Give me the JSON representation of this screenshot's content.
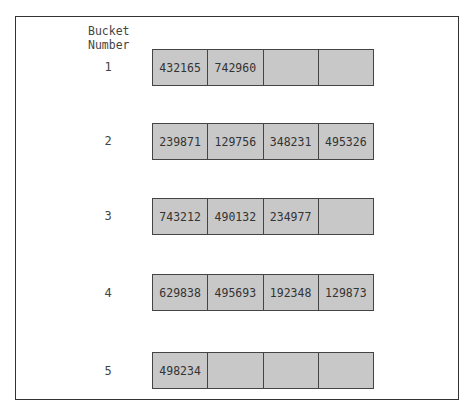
{
  "header": {
    "line1": "Bucket",
    "line2": "Number"
  },
  "colors": {
    "cell_fill": "#c8c8c8",
    "border": "#444444"
  },
  "buckets": [
    {
      "number": "1",
      "cells": [
        "432165",
        "742960",
        "",
        ""
      ]
    },
    {
      "number": "2",
      "cells": [
        "239871",
        "129756",
        "348231",
        "495326"
      ]
    },
    {
      "number": "3",
      "cells": [
        "743212",
        "490132",
        "234977",
        ""
      ]
    },
    {
      "number": "4",
      "cells": [
        "629838",
        "495693",
        "192348",
        "129873"
      ]
    },
    {
      "number": "5",
      "cells": [
        "498234",
        "",
        "",
        ""
      ]
    }
  ]
}
